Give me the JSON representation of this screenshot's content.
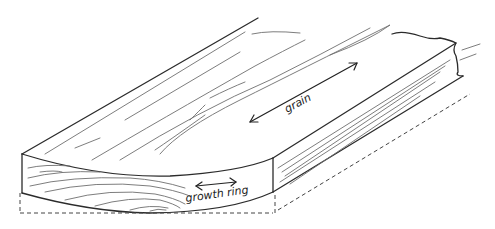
{
  "figure": {
    "labels": {
      "grain": "grain",
      "growth_ring": "growth ring"
    },
    "colors": {
      "ink": "#2b2b2b",
      "grain_line": "#6e6e6e",
      "background": "#ffffff"
    }
  }
}
